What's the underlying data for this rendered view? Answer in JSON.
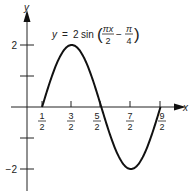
{
  "chart_data": {
    "type": "line",
    "equation": {
      "lhs": "y",
      "eq": "=",
      "coef": "2",
      "fn": "sin",
      "frac1_num": "πx",
      "frac1_den": "2",
      "minus": "−",
      "frac2_num": "π",
      "frac2_den": "4"
    },
    "xlabel": "x",
    "ylabel": "y",
    "x_ticks": [
      {
        "value": 0.5,
        "num": "1",
        "den": "2"
      },
      {
        "value": 1.5,
        "num": "3",
        "den": "2"
      },
      {
        "value": 2.5,
        "num": "5",
        "den": "2"
      },
      {
        "value": 3.5,
        "num": "7",
        "den": "2"
      },
      {
        "value": 4.5,
        "num": "9",
        "den": "2"
      }
    ],
    "y_ticks": [
      {
        "value": 2,
        "label": "2"
      },
      {
        "value": 1,
        "label": ""
      },
      {
        "value": -1,
        "label": ""
      },
      {
        "value": -2,
        "label": "−2"
      }
    ],
    "xlim": [
      0,
      5
    ],
    "ylim": [
      -2.7,
      3.2
    ],
    "x": [
      0.5,
      1.0,
      1.5,
      2.0,
      2.5,
      3.0,
      3.5,
      4.0,
      4.5
    ],
    "y": [
      0,
      1.414,
      2,
      1.414,
      0,
      -1.414,
      -2,
      -1.414,
      0
    ],
    "domain": [
      0.5,
      4.5
    ],
    "grid": false
  }
}
